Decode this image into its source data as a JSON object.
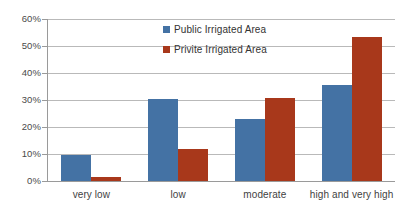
{
  "chart_data": {
    "type": "bar",
    "title": "",
    "subtitle": "",
    "xlabel": "",
    "ylabel": "",
    "grid": "horizontal",
    "legend_position": "inside-upper-center",
    "ylim": [
      0,
      60
    ],
    "ytick_labels": [
      "60%",
      "50%",
      "40%",
      "30%",
      "20%",
      "10%",
      "0%"
    ],
    "ytick_values": [
      60,
      50,
      40,
      30,
      20,
      10,
      0
    ],
    "categories": [
      "very low",
      "low",
      "moderate",
      "high and very high"
    ],
    "series": [
      {
        "name": "Public Irrigated Area",
        "color": "#4472a4",
        "values": [
          9.8,
          30.2,
          23.0,
          35.5
        ]
      },
      {
        "name": "Privite Irrigated Area",
        "color": "#a8381b",
        "values": [
          1.5,
          12.0,
          30.8,
          53.5
        ]
      }
    ]
  },
  "legend": {
    "items": [
      {
        "label": "Public Irrigated Area",
        "swatch": "legend-swatch-public"
      },
      {
        "label": "Privite Irrigated Area",
        "swatch": "legend-swatch-private"
      }
    ]
  }
}
